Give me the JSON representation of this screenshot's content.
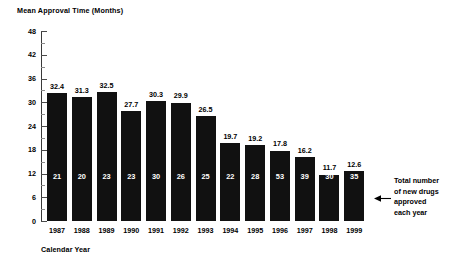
{
  "chart_data": {
    "type": "bar",
    "title": "",
    "ylabel": "Mean Approval Time (Months)",
    "xlabel": "Calendar Year",
    "categories": [
      "1987",
      "1988",
      "1989",
      "1990",
      "1991",
      "1992",
      "1993",
      "1994",
      "1995",
      "1996",
      "1997",
      "1998",
      "1999"
    ],
    "values": [
      32.4,
      31.3,
      32.5,
      27.7,
      30.3,
      29.9,
      26.5,
      19.7,
      19.2,
      17.8,
      16.2,
      11.7,
      12.6
    ],
    "value_labels": [
      "32.4",
      "31.3",
      "32.5",
      "27.7",
      "30.3",
      "29.9",
      "26.5",
      "19.7",
      "19.2",
      "17.8",
      "16.2",
      "11.7",
      "12.6"
    ],
    "bar_inner_labels": [
      "21",
      "20",
      "23",
      "23",
      "30",
      "26",
      "25",
      "22",
      "28",
      "53",
      "39",
      "30",
      "35"
    ],
    "bar_inner_series_name": "Total number of new drugs approved each year",
    "ylim": [
      0,
      48
    ],
    "yticks": [
      "0",
      "6",
      "12",
      "18",
      "24",
      "30",
      "36",
      "42",
      "48"
    ],
    "ytick_values": [
      0,
      6,
      12,
      18,
      24,
      30,
      36,
      42,
      48
    ],
    "grid": false,
    "legend": "none",
    "bar_color": "#111111",
    "background_color": "#ffffff",
    "annotation": {
      "lines": [
        "Total number",
        "of new drugs",
        "approved",
        "each year"
      ],
      "target": "bar-inner-labels"
    }
  }
}
